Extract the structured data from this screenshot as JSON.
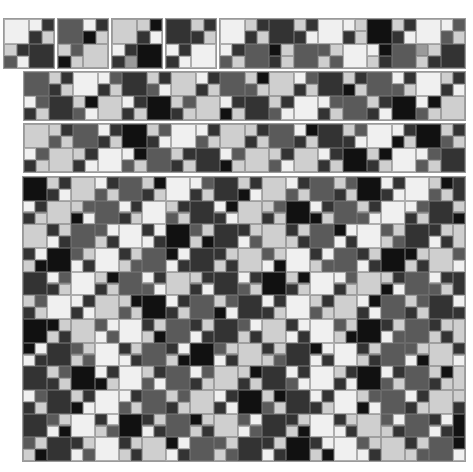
{
  "palette": [
    "#111111",
    "#333333",
    "#5a5a5a",
    "#9a9a9a",
    "#cfcfcf",
    "#f0f0f0"
  ],
  "layout": "checkerboard of 2x2 blocks: blocks where (bx+by) is even are one big square, others split into four small cells",
  "panels": [
    {
      "name": "tile-1",
      "x": 4,
      "y": 19,
      "w": 50,
      "h": 49,
      "cols": 4,
      "rows": 4,
      "big": [
        5,
        1
      ],
      "small": [
        5,
        1,
        1,
        4,
        4,
        1,
        2,
        5
      ]
    },
    {
      "name": "tile-2",
      "x": 58,
      "y": 19,
      "w": 50,
      "h": 49,
      "cols": 4,
      "rows": 4,
      "big": [
        2,
        4
      ],
      "small": [
        5,
        1,
        0,
        4,
        4,
        2,
        0,
        4
      ]
    },
    {
      "name": "tile-3",
      "x": 112,
      "y": 19,
      "w": 50,
      "h": 49,
      "cols": 4,
      "rows": 4,
      "big": [
        4,
        0
      ],
      "small": [
        4,
        0,
        1,
        5,
        5,
        1,
        1,
        3
      ]
    },
    {
      "name": "tile-4",
      "x": 166,
      "y": 19,
      "w": 50,
      "h": 49,
      "cols": 4,
      "rows": 4,
      "big": [
        1,
        5
      ],
      "small": [
        4,
        1,
        1,
        4,
        5,
        1,
        1,
        5
      ]
    },
    {
      "name": "tile-long",
      "x": 220,
      "y": 19,
      "w": 245,
      "h": 49,
      "cols": 20,
      "rows": 4,
      "big": [
        5,
        1,
        5,
        0,
        5,
        2,
        2,
        5,
        2,
        1
      ],
      "small": [
        4,
        1,
        1,
        4,
        4,
        1,
        1,
        5,
        5,
        4,
        1,
        4,
        4,
        1,
        1,
        5,
        5,
        2,
        2,
        4,
        5,
        1,
        2,
        4,
        0,
        4,
        1,
        4,
        2,
        4,
        4,
        2,
        5,
        0,
        4,
        1,
        3,
        4,
        4,
        1
      ]
    },
    {
      "name": "strip-1",
      "x": 24,
      "y": 72,
      "w": 441,
      "h": 48,
      "cols": 36,
      "rows": 4,
      "big": [
        2,
        5,
        1,
        4,
        2,
        4,
        1,
        2,
        5,
        1,
        4,
        0,
        4,
        1,
        5,
        2,
        0,
        4
      ],
      "small": [
        4,
        1,
        1,
        4,
        5,
        2,
        1,
        4,
        4,
        1,
        2,
        5,
        5,
        1,
        1,
        4,
        4,
        0,
        2,
        4,
        5,
        2,
        1,
        4,
        4,
        1,
        0,
        4,
        5,
        1,
        2,
        4,
        4,
        1,
        1,
        5,
        5,
        2,
        1,
        4,
        4,
        0,
        2,
        5,
        5,
        1,
        1,
        4,
        4,
        2,
        1,
        4,
        5,
        1,
        0,
        4,
        4,
        1,
        2,
        5,
        5,
        2,
        1,
        4,
        4,
        1,
        1,
        5,
        5,
        0,
        2,
        4
      ]
    },
    {
      "name": "strip-2",
      "x": 24,
      "y": 124,
      "w": 441,
      "h": 48,
      "cols": 36,
      "rows": 4,
      "big": [
        4,
        2,
        0,
        5,
        4,
        2,
        1,
        5,
        0,
        4,
        5,
        2,
        1,
        4,
        4,
        0,
        5,
        1
      ],
      "small": [
        4,
        1,
        2,
        4,
        5,
        1,
        1,
        4,
        4,
        2,
        1,
        5,
        5,
        1,
        2,
        4,
        4,
        1,
        1,
        4,
        5,
        0,
        1,
        4,
        4,
        2,
        1,
        5,
        5,
        1,
        0,
        4,
        4,
        1,
        2,
        4,
        5,
        2,
        1,
        4,
        4,
        1,
        1,
        5,
        5,
        0,
        2,
        4,
        4,
        1,
        1,
        4,
        5,
        2,
        0,
        4,
        4,
        1,
        2,
        5,
        5,
        1,
        1,
        4,
        4,
        0,
        1,
        4,
        5,
        2,
        2,
        4
      ]
    },
    {
      "name": "big-panel",
      "x": 23,
      "y": 177,
      "w": 442,
      "h": 284,
      "cols": 37,
      "rows": 24,
      "big": [
        0,
        4,
        2,
        5,
        1,
        4,
        2,
        0,
        5,
        1,
        4,
        2,
        5,
        1,
        4,
        0,
        2,
        5,
        1,
        4,
        2,
        5,
        0,
        1,
        4,
        2,
        5,
        1,
        4,
        0,
        5,
        2,
        1,
        4,
        5,
        2,
        0,
        4,
        1,
        5,
        2,
        4,
        1,
        0,
        5,
        4,
        2,
        1,
        5,
        4,
        0,
        2,
        1,
        5,
        4,
        2,
        1,
        0,
        4,
        5,
        2,
        1,
        4,
        5,
        0,
        2,
        4,
        1,
        5,
        2,
        0,
        4,
        1,
        5,
        2,
        4,
        1,
        0,
        5,
        2,
        4,
        1,
        5,
        0,
        2,
        4,
        1,
        5,
        2,
        4,
        0,
        1,
        5,
        2,
        4,
        1,
        5,
        0,
        2,
        4,
        1,
        5,
        4,
        2,
        0,
        1,
        5,
        4,
        2,
        1,
        0,
        5,
        4,
        2
      ],
      "small": [
        4,
        1,
        1,
        5,
        5,
        1,
        2,
        4,
        4,
        0,
        1,
        4,
        5,
        2,
        1,
        4,
        4,
        1,
        0,
        5,
        5,
        1,
        2,
        4,
        4,
        2,
        1,
        4,
        5,
        1,
        1,
        5,
        4,
        0,
        2,
        4,
        5,
        1,
        1,
        4,
        4,
        2,
        0,
        5,
        5,
        1,
        1,
        4,
        4,
        1,
        2,
        4,
        5,
        0,
        1,
        5,
        4,
        2,
        1,
        4,
        5,
        1,
        0,
        4,
        4,
        1,
        2,
        5,
        5,
        2,
        1,
        4,
        4,
        0,
        1,
        4,
        5,
        1,
        2,
        5
      ]
    }
  ]
}
